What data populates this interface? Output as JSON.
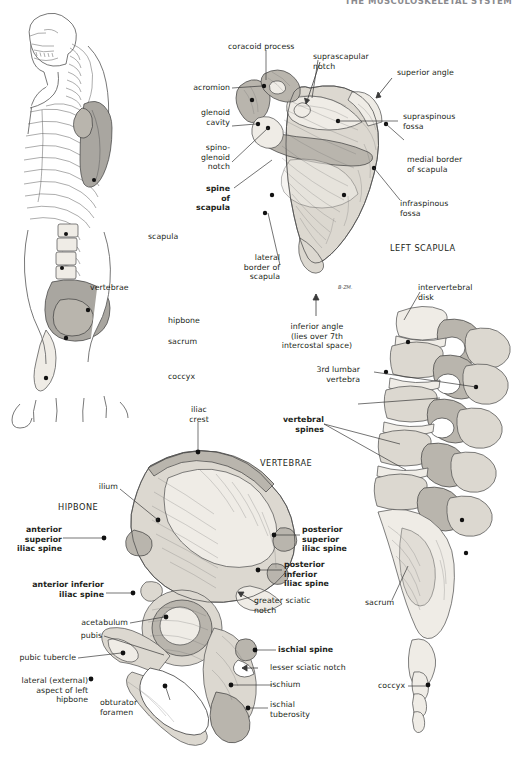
{
  "header": {
    "running_title": "THE MUSCULOSKELETAL SYSTEM"
  },
  "figures": {
    "torso": {
      "name": "skeleton-torso-lateral",
      "labels": [
        {
          "id": "scapula",
          "text": "scapula",
          "bold": false
        },
        {
          "id": "vertebrae",
          "text": "vertebrae",
          "bold": false
        },
        {
          "id": "hipbone",
          "text": "hipbone",
          "bold": false
        },
        {
          "id": "sacrum",
          "text": "sacrum",
          "bold": false
        },
        {
          "id": "coccyx",
          "text": "coccyx",
          "bold": false
        }
      ]
    },
    "scapula": {
      "name": "left-scapula-posterior",
      "caption": "LEFT SCAPULA",
      "artist_signature": "B-ZM.",
      "labels": [
        {
          "id": "coracoid-process",
          "text": "coracoid process",
          "bold": false
        },
        {
          "id": "suprascapular-notch",
          "text": "suprascapular\nnotch",
          "bold": false
        },
        {
          "id": "superior-angle",
          "text": "superior angle",
          "bold": false
        },
        {
          "id": "acromion",
          "text": "acromion",
          "bold": false
        },
        {
          "id": "glenoid-cavity",
          "text": "glenoid\ncavity",
          "bold": false
        },
        {
          "id": "supraspinous-fossa",
          "text": "supraspinous\nfossa",
          "bold": false
        },
        {
          "id": "spinoglenoid-notch",
          "text": "spino-\nglenoid\nnotch",
          "bold": false
        },
        {
          "id": "medial-border",
          "text": "medial border\nof scapula",
          "bold": false
        },
        {
          "id": "spine-of-scapula",
          "text": "spine\nof\nscapula",
          "bold": true
        },
        {
          "id": "infraspinous-fossa",
          "text": "infraspinous\nfossa",
          "bold": false
        },
        {
          "id": "lateral-border",
          "text": "lateral\nborder of\nscapula",
          "bold": false
        },
        {
          "id": "inferior-angle",
          "text": "inferior angle\n(lies over 7th\nintercostal space)",
          "bold": false
        }
      ]
    },
    "vertebrae": {
      "name": "lumbar-vertebrae-lateral",
      "caption": "VERTEBRAE",
      "labels": [
        {
          "id": "intervertebral-disk",
          "text": "intervertebral\ndisk",
          "bold": false
        },
        {
          "id": "third-lumbar",
          "text": "3rd lumbar\nvertebra",
          "bold": false
        },
        {
          "id": "vertebral-spines",
          "text": "vertebral\nspines",
          "bold": true
        },
        {
          "id": "sacrum",
          "text": "sacrum",
          "bold": false
        },
        {
          "id": "coccyx",
          "text": "coccyx",
          "bold": false
        }
      ]
    },
    "hipbone": {
      "name": "left-hipbone-lateral",
      "caption": "HIPBONE",
      "sub_caption": "lateral (external)\naspect of left\nhipbone",
      "labels": [
        {
          "id": "iliac-crest",
          "text": "iliac\ncrest",
          "bold": false
        },
        {
          "id": "ilium",
          "text": "ilium",
          "bold": false
        },
        {
          "id": "anterior-superior-iliac-spine",
          "text": "anterior superior\niliac spine",
          "bold": true
        },
        {
          "id": "anterior-inferior-iliac-spine",
          "text": "anterior inferior\niliac spine",
          "bold": true
        },
        {
          "id": "acetabulum",
          "text": "acetabulum",
          "bold": false
        },
        {
          "id": "pubis",
          "text": "pubis",
          "bold": false
        },
        {
          "id": "pubic-tubercle",
          "text": "pubic tubercle",
          "bold": false
        },
        {
          "id": "obturator-foramen",
          "text": "obturator\nforamen",
          "bold": false
        },
        {
          "id": "posterior-superior-iliac-spine",
          "text": "posterior\nsuperior\niliac spine",
          "bold": true
        },
        {
          "id": "posterior-inferior-iliac-spine",
          "text": "posterior\ninferior\niliac spine",
          "bold": true
        },
        {
          "id": "greater-sciatic-notch",
          "text": "greater sciatic\nnotch",
          "bold": false
        },
        {
          "id": "ischial-spine",
          "text": "ischial spine",
          "bold": true
        },
        {
          "id": "lesser-sciatic-notch",
          "text": "lesser sciatic notch",
          "bold": false
        },
        {
          "id": "ischium",
          "text": "ischium",
          "bold": false
        },
        {
          "id": "ischial-tuberosity",
          "text": "ischial\ntuberosity",
          "bold": false
        }
      ]
    }
  },
  "colors": {
    "ink": "#231f20",
    "bone_light": "#efece6",
    "bone_mid": "#dcd8d0",
    "bone_dark": "#b9b5ad",
    "stroke": "#4a4a4a",
    "page_bg": "#ffffff"
  }
}
